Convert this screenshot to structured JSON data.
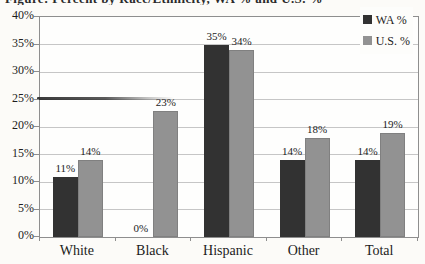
{
  "caption": {
    "text": "Figure: Percent by Race/Ethnicity, WA % and U.S. %"
  },
  "chart_data": {
    "type": "bar",
    "title": "",
    "xlabel": "",
    "ylabel": "",
    "categories": [
      "White",
      "Black",
      "Hispanic",
      "Other",
      "Total"
    ],
    "series": [
      {
        "name": "WA %",
        "color": "#323232",
        "values": [
          11,
          0,
          35,
          14,
          14
        ],
        "labels": [
          "11%",
          "0%",
          "35%",
          "14%",
          "14%"
        ]
      },
      {
        "name": "U.S. %",
        "color": "#929292",
        "values": [
          14,
          23,
          34,
          18,
          19
        ],
        "labels": [
          "14%",
          "23%",
          "34%",
          "18%",
          "19%"
        ]
      }
    ],
    "y_ticks": [
      "0%",
      "5%",
      "10%",
      "15%",
      "20%",
      "25%",
      "30%",
      "35%",
      "40%"
    ],
    "ylim": [
      0,
      40
    ],
    "ytick_step": 5,
    "grid": true,
    "legend_position": "top-right-inside"
  },
  "colors": {
    "background": "#fcfbf8",
    "plot_border": "#8e8e8e",
    "gridline": "#c6c6c6",
    "bar_wa": "#323232",
    "bar_us": "#929292",
    "text": "#1c1c1c",
    "artifact_mark": "#2a2a2a"
  }
}
